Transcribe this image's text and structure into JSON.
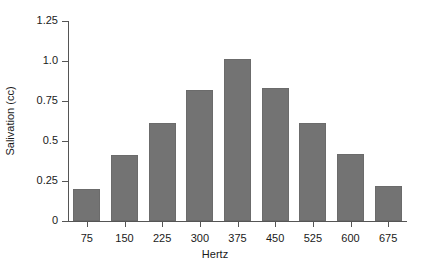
{
  "chart_data": {
    "type": "bar",
    "title": "",
    "subtitle": "",
    "xlabel": "Hertz",
    "ylabel": "Salivation (cc)",
    "categories": [
      "75",
      "150",
      "225",
      "300",
      "375",
      "450",
      "525",
      "600",
      "675"
    ],
    "values": [
      0.2,
      0.41,
      0.61,
      0.82,
      1.01,
      0.83,
      0.61,
      0.42,
      0.22
    ],
    "series": [
      {
        "name": "Salivation",
        "values": [
          0.2,
          0.41,
          0.61,
          0.82,
          1.01,
          0.83,
          0.61,
          0.42,
          0.22
        ]
      }
    ],
    "ylim": [
      0,
      1.25
    ],
    "y_ticks": [
      0,
      0.25,
      0.5,
      0.75,
      1.0,
      1.25
    ],
    "y_tick_labels": [
      "0",
      "0.25",
      "0.5",
      "0.75",
      "1.0",
      "1.25"
    ],
    "grid": false,
    "legend": null,
    "legend_position": "none",
    "bar_color": "#737373",
    "axis_color": "#555555",
    "background_color": "#ffffff",
    "annotations": []
  }
}
